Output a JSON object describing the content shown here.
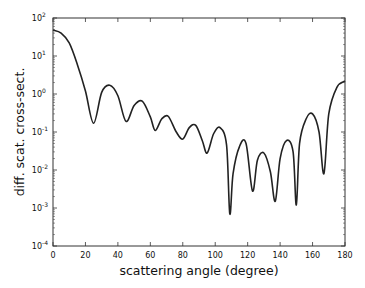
{
  "chart_data": {
    "type": "line",
    "title": "",
    "xlabel": "scattering angle (degree)",
    "ylabel": "diff. scat. cross-sect.",
    "xlim": [
      0,
      180
    ],
    "ylim": [
      0.0001,
      100
    ],
    "yscale": "log",
    "grid": false,
    "legend": null,
    "x_ticks": [
      0,
      20,
      40,
      60,
      80,
      100,
      120,
      140,
      160,
      180
    ],
    "y_ticks": [
      {
        "base": "10",
        "exp": "2"
      },
      {
        "base": "10",
        "exp": "1"
      },
      {
        "base": "10",
        "exp": "0"
      },
      {
        "base": "10",
        "exp": "-1"
      },
      {
        "base": "10",
        "exp": "-2"
      },
      {
        "base": "10",
        "exp": "-3"
      },
      {
        "base": "10",
        "exp": "-4"
      }
    ],
    "series": [
      {
        "name": "diff. scat. cross-sect.",
        "color": "#222222",
        "x": [
          0,
          5,
          10,
          15,
          20,
          25,
          30,
          35,
          40,
          45,
          50,
          55,
          60,
          63,
          67,
          71,
          76,
          80,
          84,
          88,
          92,
          95,
          99,
          103,
          107,
          109,
          111,
          115,
          119,
          123,
          126,
          130,
          134,
          137,
          140,
          144,
          148,
          150,
          152,
          156,
          160,
          164,
          167,
          170,
          175,
          180
        ],
        "values": [
          48,
          40,
          22,
          6,
          1.2,
          0.17,
          1.1,
          1.7,
          0.9,
          0.19,
          0.5,
          0.65,
          0.25,
          0.11,
          0.22,
          0.26,
          0.1,
          0.065,
          0.13,
          0.15,
          0.06,
          0.028,
          0.09,
          0.13,
          0.045,
          0.0007,
          0.008,
          0.042,
          0.05,
          0.0028,
          0.018,
          0.028,
          0.009,
          0.0015,
          0.02,
          0.06,
          0.03,
          0.0012,
          0.05,
          0.22,
          0.3,
          0.1,
          0.008,
          0.3,
          1.5,
          2.2
        ]
      }
    ]
  }
}
